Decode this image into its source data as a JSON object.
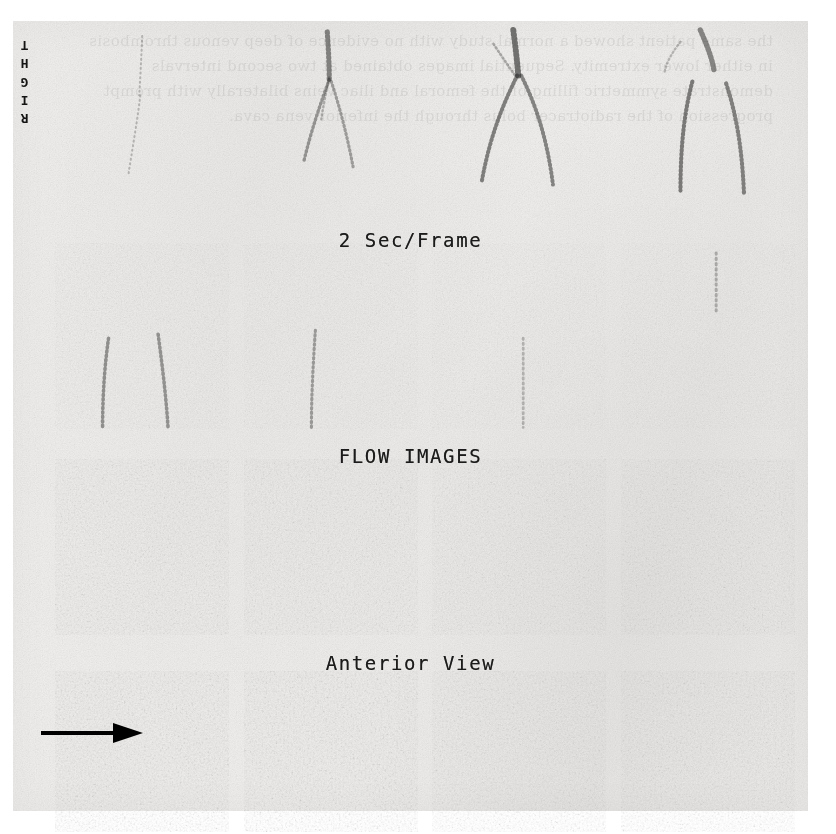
{
  "document": {
    "kind": "scanned figure",
    "modality": "radionuclide venogram / perfusion flow study",
    "orientation_marker": "RIGHT",
    "bleed_through_text": "the same patient showed a normal study with no evidence of deep venous thrombosis in either lower extremity. Sequential images obtained at two second intervals demonstrate symmetric filling of the femoral and iliac veins bilaterally with prompt progression of the radiotracer bolus through the inferior vena cava."
  },
  "captions": {
    "frame_rate": "2 Sec/Frame",
    "series_title": "FLOW IMAGES",
    "view": "Anterior View"
  },
  "annotation": {
    "arrow_label": "region-of-interest arrow",
    "arrow_direction": "right",
    "arrow_color": "#000000"
  },
  "grid": {
    "rows": 4,
    "columns": 4,
    "rows_detail": [
      {
        "row_index": 1,
        "label": "early arterial / bolus transit",
        "frames": [
          {
            "frame_index": 1,
            "content": "faint diffuse background, minimal vessel activity"
          },
          {
            "frame_index": 2,
            "content": "central vessel column with early bifurcation"
          },
          {
            "frame_index": 3,
            "content": "prominent inverted-V bilateral iliac/femoral branching"
          },
          {
            "frame_index": 4,
            "content": "bilateral vessel limbs, symmetric tracer filling"
          }
        ]
      },
      {
        "row_index": 2,
        "label": "venous filling phase",
        "frames": [
          {
            "frame_index": 1,
            "content": "speckled soft-tissue background with two vertical vessel tracks"
          },
          {
            "frame_index": 2,
            "content": "linear vessel activity, moderate background counts"
          },
          {
            "frame_index": 3,
            "content": "diffuse counts, faint vessel outline"
          },
          {
            "frame_index": 4,
            "content": "diffuse counts, vessel activity fading"
          }
        ]
      },
      {
        "row_index": 3,
        "label": "equilibrium / soft tissue phase",
        "frames": [
          {
            "frame_index": 1,
            "content": "homogeneous speckled soft-tissue activity"
          },
          {
            "frame_index": 2,
            "content": "homogeneous speckled soft-tissue activity"
          },
          {
            "frame_index": 3,
            "content": "homogeneous speckled soft-tissue activity"
          },
          {
            "frame_index": 4,
            "content": "homogeneous speckled soft-tissue activity"
          }
        ]
      },
      {
        "row_index": 4,
        "label": "late / delayed phase",
        "frames": [
          {
            "frame_index": 1,
            "content": "soft-tissue activity, arrow indicates level of interest"
          },
          {
            "frame_index": 2,
            "content": "homogeneous speckled soft-tissue activity"
          },
          {
            "frame_index": 3,
            "content": "homogeneous speckled soft-tissue activity"
          },
          {
            "frame_index": 4,
            "content": "homogeneous speckled soft-tissue activity"
          }
        ]
      }
    ]
  },
  "colors": {
    "paper": "#f1f0ee",
    "ink": "#1b1b1b",
    "counts": "#4a4a4a",
    "page_background": "#ffffff"
  }
}
